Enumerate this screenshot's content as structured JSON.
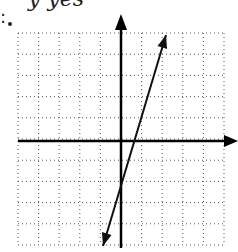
{
  "header": {
    "cut_text": "y yes",
    "cut_text2": ":"
  },
  "graph": {
    "grid": {
      "x0": 18,
      "y0": 33,
      "x1": 224,
      "y1": 245,
      "cols": 10,
      "rows": 10,
      "color": "#555555"
    },
    "axes": {
      "origin_x": 121,
      "origin_y": 141,
      "color": "#000000"
    },
    "line": {
      "x1": 166,
      "y1": 35,
      "x2": 103,
      "y2": 246,
      "color": "#111111"
    }
  }
}
